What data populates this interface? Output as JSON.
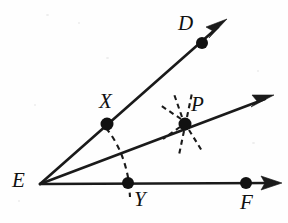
{
  "figure": {
    "background_color": "#fefefe",
    "ink_color": "#1a1a1a",
    "width": 288,
    "height": 223
  },
  "labels": {
    "vertex_e": "E",
    "point_d": "D",
    "point_f": "F",
    "point_x": "X",
    "point_y": "Y",
    "point_p": "P"
  },
  "points": [
    {
      "name": "E",
      "label": "E",
      "x": 40,
      "y": 184,
      "role": "vertex",
      "marked": false
    },
    {
      "name": "D",
      "label": "D",
      "x": 202,
      "y": 43,
      "role": "ray-point",
      "marked": true
    },
    {
      "name": "X",
      "label": "X",
      "x": 107,
      "y": 124,
      "role": "arc-intersection",
      "marked": true
    },
    {
      "name": "P",
      "label": "P",
      "x": 185,
      "y": 124,
      "role": "arc-intersection",
      "marked": true
    },
    {
      "name": "Y",
      "label": "Y",
      "x": 128,
      "y": 183,
      "role": "arc-intersection",
      "marked": true
    },
    {
      "name": "F",
      "label": "F",
      "x": 246,
      "y": 183,
      "role": "ray-point",
      "marked": true
    }
  ],
  "rays": [
    {
      "name": "ray-ed",
      "from": "E",
      "through": "D",
      "x1": 40,
      "y1": 184,
      "x2": 226,
      "y2": 20,
      "arrow": true
    },
    {
      "name": "ray-ep",
      "from": "E",
      "through": "P",
      "x1": 40,
      "y1": 184,
      "x2": 272,
      "y2": 96,
      "arrow": true
    },
    {
      "name": "ray-ef",
      "from": "E",
      "through": "F",
      "x1": 40,
      "y1": 184,
      "x2": 281,
      "y2": 183,
      "arrow": true
    }
  ],
  "construction_marks": {
    "arc_xy": {
      "name": "dashed-arc-x-to-y",
      "from": "X",
      "to": "Y",
      "style": "dashed"
    },
    "ticks_at_p": {
      "name": "dashed-ticks-at-p",
      "count": 6,
      "style": "dashed",
      "around": "P"
    }
  }
}
